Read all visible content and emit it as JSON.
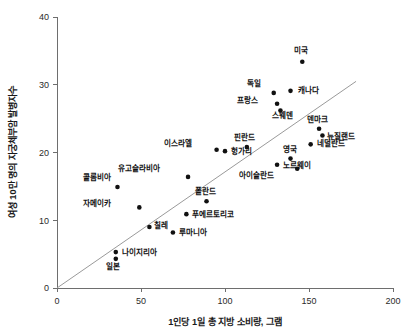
{
  "chart_data": {
    "type": "scatter",
    "title": "",
    "xlabel": "1인당 1일 총 지방 소비량, 그램",
    "ylabel": "여성 10만 명의 자궁체부암 발병자수",
    "xlim": [
      0,
      200
    ],
    "ylim": [
      0,
      40
    ],
    "xticks": [
      0,
      50,
      100,
      150,
      200
    ],
    "yticks": [
      0,
      10,
      20,
      30,
      40
    ],
    "xtick_labels": [
      "0",
      "50",
      "100",
      "150",
      "200"
    ],
    "ytick_labels": [
      "0",
      "10",
      "20",
      "30",
      "40"
    ],
    "grid": false,
    "legend": "none",
    "trendline": {
      "label": "",
      "x_start": 0,
      "y_start": 0,
      "x_end": 178,
      "y_end": 30.5
    },
    "point_color": "#111111",
    "line_color": "#9a9a9a",
    "axis_color": "#6e6e6e",
    "points": [
      {
        "label": "미국",
        "x": 146,
        "y": 33.4,
        "lx": -1,
        "ly": -9
      },
      {
        "label": "독일",
        "x": 129,
        "y": 28.8,
        "lx": -13,
        "ly": -7
      },
      {
        "label": "캐나다",
        "x": 139,
        "y": 29.1,
        "lx": 7,
        "ly": 2
      },
      {
        "label": "프랑스",
        "x": 131,
        "y": 27.2,
        "lx": -19,
        "ly": -1
      },
      {
        "label": "스웨덴",
        "x": 133,
        "y": 26.2,
        "lx": 2,
        "ly": 8
      },
      {
        "label": "덴마크",
        "x": 156,
        "y": 23.5,
        "lx": -2,
        "ly": -7
      },
      {
        "label": "뉴질랜드",
        "x": 158,
        "y": 22.5,
        "lx": 5,
        "ly": 3
      },
      {
        "label": "네덜란드",
        "x": 151,
        "y": 21.2,
        "lx": 6,
        "ly": 2
      },
      {
        "label": "영국",
        "x": 139,
        "y": 19.1,
        "lx": -1,
        "ly": -7
      },
      {
        "label": "노르웨이",
        "x": 131,
        "y": 18.2,
        "lx": 6,
        "ly": 3
      },
      {
        "label": "아이슬란드",
        "x": 143,
        "y": 17.6,
        "lx": -23,
        "ly": 9
      },
      {
        "label": "핀란드",
        "x": 113,
        "y": 20.8,
        "lx": -2,
        "ly": -7
      },
      {
        "label": "헝가리",
        "x": 100,
        "y": 20.2,
        "lx": 6,
        "ly": 3
      },
      {
        "label": "이스라엘",
        "x": 95,
        "y": 20.4,
        "lx": -25,
        "ly": -4
      },
      {
        "label": "유고슬라비아",
        "x": 78,
        "y": 16.4,
        "lx": -28,
        "ly": -6
      },
      {
        "label": "폴란드",
        "x": 89,
        "y": 12.8,
        "lx": -1,
        "ly": -7
      },
      {
        "label": "푸에르토리코",
        "x": 77,
        "y": 10.9,
        "lx": 6,
        "ly": 3
      },
      {
        "label": "루마니아",
        "x": 69,
        "y": 8.2,
        "lx": 6,
        "ly": 3
      },
      {
        "label": "칠레",
        "x": 55,
        "y": 9.0,
        "lx": 5,
        "ly": 1
      },
      {
        "label": "콜롬비아",
        "x": 36,
        "y": 14.9,
        "lx": -6,
        "ly": -7
      },
      {
        "label": "자메이카",
        "x": 49,
        "y": 11.9,
        "lx": -28,
        "ly": -1
      },
      {
        "label": "나이지리아",
        "x": 35,
        "y": 5.3,
        "lx": 6,
        "ly": 3
      },
      {
        "label": "일본",
        "x": 35,
        "y": 4.3,
        "lx": -3,
        "ly": 10
      }
    ]
  }
}
